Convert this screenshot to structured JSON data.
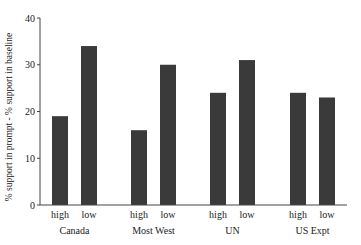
{
  "chart_data": {
    "type": "bar",
    "title": "",
    "xlabel": "",
    "ylabel": "% support in prompt - % support in baseline",
    "ylim": [
      0,
      40
    ],
    "yticks": [
      0,
      10,
      20,
      30,
      40
    ],
    "grid": false,
    "legend": null,
    "groups": [
      "Canada",
      "Most West",
      "UN",
      "US Expt"
    ],
    "subcategories": [
      "high",
      "low"
    ],
    "series": [
      {
        "name": "high",
        "values": [
          19,
          16,
          24,
          24
        ]
      },
      {
        "name": "low",
        "values": [
          34,
          30,
          31,
          23
        ]
      }
    ],
    "bars": [
      {
        "group": "Canada",
        "label": "high",
        "value": 19
      },
      {
        "group": "Canada",
        "label": "low",
        "value": 34
      },
      {
        "group": "Most West",
        "label": "high",
        "value": 16
      },
      {
        "group": "Most West",
        "label": "low",
        "value": 30
      },
      {
        "group": "UN",
        "label": "high",
        "value": 24
      },
      {
        "group": "UN",
        "label": "low",
        "value": 31
      },
      {
        "group": "US Expt",
        "label": "high",
        "value": 24
      },
      {
        "group": "US Expt",
        "label": "low",
        "value": 23
      }
    ],
    "bar_color": "#3a3a3a"
  }
}
